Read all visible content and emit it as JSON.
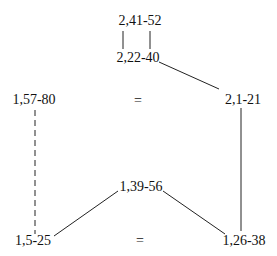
{
  "diagram": {
    "nodes": {
      "top": {
        "label": "2,41-52"
      },
      "upper_mid": {
        "label": "2,22-40"
      },
      "left_mid": {
        "label": "1,57-80"
      },
      "right_mid": {
        "label": "2,1-21"
      },
      "center_low": {
        "label": "1,39-56"
      },
      "bottom_left": {
        "label": "1,5-25"
      },
      "bottom_right": {
        "label": "1,26-38"
      }
    },
    "equals_signs": {
      "middle_row": "=",
      "bottom_row": "="
    },
    "edges": [
      {
        "from": "top",
        "to": "upper_mid",
        "style": "double-solid"
      },
      {
        "from": "upper_mid",
        "to": "right_mid",
        "style": "solid"
      },
      {
        "from": "left_mid",
        "to": "bottom_left",
        "style": "dashed"
      },
      {
        "from": "right_mid",
        "to": "bottom_right",
        "style": "solid"
      },
      {
        "from": "center_low",
        "to": "bottom_left",
        "style": "solid"
      },
      {
        "from": "center_low",
        "to": "bottom_right",
        "style": "solid"
      }
    ]
  }
}
